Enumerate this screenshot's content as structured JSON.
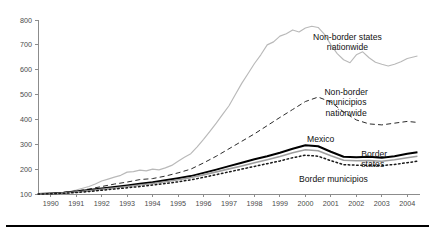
{
  "chart_data": {
    "type": "line",
    "title": "",
    "subtitle": "",
    "xlabel": "",
    "ylabel": "",
    "xlim": [
      1990,
      2005
    ],
    "ylim": [
      100,
      800
    ],
    "grid": false,
    "legend_position": "inline-annotations",
    "x_tick_labels": [
      "1990",
      "1991",
      "1992",
      "1993",
      "1994",
      "1995",
      "1996",
      "1997",
      "1998",
      "1999",
      "2000",
      "2001",
      "2002",
      "2003",
      "2004"
    ],
    "x_ticks": [
      1990,
      1991,
      1992,
      1993,
      1994,
      1995,
      1996,
      1997,
      1998,
      1999,
      2000,
      2001,
      2002,
      2003,
      2004
    ],
    "y_tick_labels": [
      "100",
      "200",
      "300",
      "400",
      "500",
      "600",
      "700",
      "800"
    ],
    "y_ticks": [
      100,
      200,
      300,
      400,
      500,
      600,
      700,
      800
    ],
    "annotations": [
      {
        "name": "non-border-states-nationwide",
        "text_line1": "Non-border states",
        "text_line2": "nationwide",
        "x": 2002.15,
        "y": 720
      },
      {
        "name": "non-border-municipios-nationwide",
        "text_line1": "Non-border",
        "text_line2": "municipios",
        "text_line3": "nationwide",
        "x": 2002.1,
        "y": 500
      },
      {
        "name": "mexico",
        "text_line1": "Mexico",
        "x": 2001.1,
        "y": 310
      },
      {
        "name": "border-states",
        "text_line1": "Border",
        "text_line2": "states",
        "x": 2004.5,
        "y": 250
      },
      {
        "name": "border-municipios",
        "text_line1": "Border municipios",
        "x": 2001.6,
        "y": 150
      }
    ],
    "series": [
      {
        "name": "Non-border states nationwide",
        "style": "solid",
        "color": "#b9b9b9",
        "x": [
          1990.0,
          1990.25,
          1990.5,
          1990.75,
          1991.0,
          1991.25,
          1991.5,
          1991.75,
          1992.0,
          1992.25,
          1992.5,
          1992.75,
          1993.0,
          1993.25,
          1993.5,
          1993.75,
          1994.0,
          1994.25,
          1994.5,
          1994.75,
          1995.0,
          1995.25,
          1995.5,
          1995.75,
          1996.0,
          1996.25,
          1996.5,
          1996.75,
          1997.0,
          1997.25,
          1997.5,
          1997.75,
          1998.0,
          1998.25,
          1998.5,
          1998.75,
          1999.0,
          1999.25,
          1999.5,
          1999.75,
          2000.0,
          2000.25,
          2000.5,
          2000.75,
          2001.0,
          2001.25,
          2001.5,
          2001.75,
          2002.0,
          2002.25,
          2002.5,
          2002.75,
          2003.0,
          2003.25,
          2003.5,
          2003.75,
          2004.0,
          2004.25,
          2004.5,
          2004.9
        ],
        "y": [
          100,
          101,
          103,
          104,
          106,
          110,
          116,
          123,
          130,
          140,
          152,
          160,
          168,
          175,
          188,
          190,
          196,
          193,
          200,
          197,
          205,
          215,
          232,
          248,
          262,
          290,
          320,
          352,
          385,
          420,
          455,
          500,
          545,
          585,
          625,
          660,
          700,
          712,
          735,
          745,
          760,
          752,
          768,
          775,
          770,
          742,
          700,
          665,
          640,
          628,
          660,
          672,
          648,
          630,
          622,
          615,
          622,
          632,
          645,
          655
        ]
      },
      {
        "name": "Non-border municipios nationwide",
        "style": "dashed",
        "color": "#2a2a2a",
        "x": [
          1990.0,
          1990.5,
          1991.0,
          1991.5,
          1992.0,
          1992.5,
          1993.0,
          1993.5,
          1994.0,
          1994.5,
          1995.0,
          1995.5,
          1996.0,
          1996.5,
          1997.0,
          1997.5,
          1998.0,
          1998.5,
          1999.0,
          1999.5,
          2000.0,
          2000.5,
          2001.0,
          2001.5,
          2002.0,
          2002.5,
          2003.0,
          2003.5,
          2004.0,
          2004.5,
          2004.9
        ],
        "y": [
          100,
          102,
          106,
          112,
          120,
          130,
          140,
          148,
          158,
          162,
          172,
          185,
          200,
          225,
          252,
          282,
          312,
          342,
          375,
          408,
          440,
          472,
          490,
          470,
          430,
          398,
          382,
          378,
          385,
          392,
          388
        ]
      },
      {
        "name": "Mexico",
        "style": "solid-bold",
        "color": "#000000",
        "x": [
          1990.0,
          1990.5,
          1991.0,
          1991.5,
          1992.0,
          1992.5,
          1993.0,
          1993.5,
          1994.0,
          1994.5,
          1995.0,
          1995.5,
          1996.0,
          1996.5,
          1997.0,
          1997.5,
          1998.0,
          1998.5,
          1999.0,
          1999.5,
          2000.0,
          2000.5,
          2001.0,
          2001.5,
          2002.0,
          2002.5,
          2003.0,
          2003.5,
          2004.0,
          2004.5,
          2004.9
        ],
        "y": [
          100,
          102,
          105,
          110,
          116,
          122,
          128,
          134,
          141,
          147,
          155,
          163,
          172,
          185,
          198,
          212,
          226,
          240,
          252,
          266,
          282,
          296,
          292,
          270,
          250,
          248,
          250,
          246,
          252,
          262,
          268
        ]
      },
      {
        "name": "Border states",
        "style": "solid",
        "color": "#9e9e9e",
        "x": [
          1990.0,
          1990.5,
          1991.0,
          1991.5,
          1992.0,
          1992.5,
          1993.0,
          1993.5,
          1994.0,
          1994.5,
          1995.0,
          1995.5,
          1996.0,
          1996.5,
          1997.0,
          1997.5,
          1998.0,
          1998.5,
          1999.0,
          1999.5,
          2000.0,
          2000.5,
          2001.0,
          2001.5,
          2002.0,
          2002.5,
          2003.0,
          2003.5,
          2004.0,
          2004.5,
          2004.9
        ],
        "y": [
          100,
          101,
          104,
          108,
          113,
          119,
          124,
          130,
          136,
          142,
          149,
          157,
          166,
          177,
          189,
          201,
          213,
          226,
          238,
          251,
          266,
          278,
          274,
          254,
          236,
          234,
          235,
          232,
          238,
          246,
          252
        ]
      },
      {
        "name": "Border municipios",
        "style": "dotted",
        "color": "#1a1a1a",
        "x": [
          1990.0,
          1990.5,
          1991.0,
          1991.5,
          1992.0,
          1992.5,
          1993.0,
          1993.5,
          1994.0,
          1994.5,
          1995.0,
          1995.5,
          1996.0,
          1996.5,
          1997.0,
          1997.5,
          1998.0,
          1998.5,
          1999.0,
          1999.5,
          2000.0,
          2000.5,
          2001.0,
          2001.5,
          2002.0,
          2002.5,
          2003.0,
          2003.5,
          2004.0,
          2004.5,
          2004.9
        ],
        "y": [
          100,
          101,
          103,
          106,
          110,
          115,
          120,
          125,
          130,
          136,
          142,
          149,
          157,
          167,
          178,
          189,
          200,
          211,
          222,
          233,
          246,
          256,
          252,
          234,
          218,
          216,
          216,
          214,
          219,
          226,
          232
        ]
      }
    ]
  }
}
